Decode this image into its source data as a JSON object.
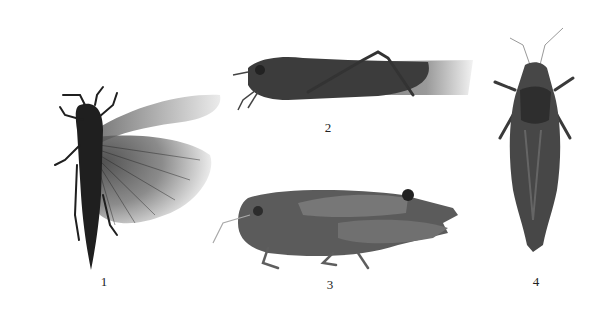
{
  "figure": {
    "panels": [
      {
        "id": "1",
        "label": "1",
        "view": "dorsal, wings spread"
      },
      {
        "id": "2",
        "label": "2",
        "view": "lateral"
      },
      {
        "id": "3",
        "label": "3",
        "view": "lateral"
      },
      {
        "id": "4",
        "label": "4",
        "view": "dorsal"
      }
    ],
    "colors": {
      "background": "#ffffff",
      "body_dark": "#2a2a2a",
      "body_mid": "#5a5a5a",
      "wing_light": "#c8c8c8",
      "label": "#222222"
    }
  }
}
